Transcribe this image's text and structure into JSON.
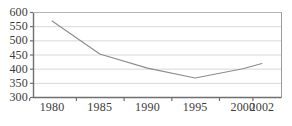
{
  "chart_data": {
    "type": "line",
    "title": "",
    "xlabel": "",
    "ylabel": "",
    "x": [
      1980,
      1985,
      1990,
      1995,
      2000,
      2002
    ],
    "categories": [
      "1980",
      "1985",
      "1990",
      "1995",
      "2000",
      "2002"
    ],
    "values": [
      568,
      452,
      402,
      367,
      400,
      418
    ],
    "series": [
      {
        "name": "series-1",
        "values": [
          568,
          452,
          402,
          367,
          400,
          418
        ]
      }
    ],
    "ylim": [
      300,
      600
    ],
    "yticks": [
      300,
      350,
      400,
      450,
      500,
      550,
      600
    ],
    "ytick_labels": [
      "300",
      "350",
      "400",
      "450",
      "500",
      "550",
      "600"
    ],
    "xlim": [
      1978,
      2004
    ],
    "xticks": [
      1980,
      1985,
      1990,
      1995,
      2000,
      2002
    ],
    "xtick_labels": [
      "1980",
      "1985",
      "1990",
      "1995",
      "2000",
      "2002"
    ],
    "grid": "horizontal",
    "legend": "none",
    "line_color": "#8c8c8c",
    "grid_color": "#d8d8d8",
    "axis_color": "#808080",
    "text_color": "#3b3b3b",
    "background_color": "#ffffff"
  }
}
